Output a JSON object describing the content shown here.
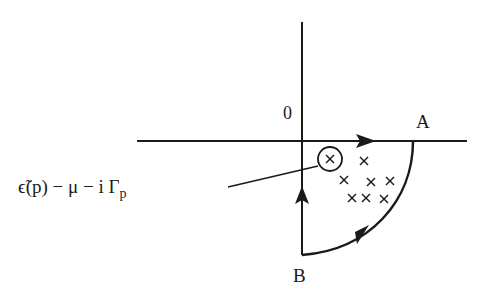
{
  "diagram": {
    "type": "complex-plane contour",
    "labels": {
      "origin": "0",
      "point_a": "A",
      "point_b": "B",
      "pole_expression": "ϵ̃(p) − μ − i Γ",
      "pole_expression_subscript": "p"
    },
    "elements": {
      "real_axis": "horizontal axis",
      "imaginary_axis": "vertical axis",
      "contour": "quarter-circle contour in lower-right quadrant: 0 → A along real axis, arc A → B, B → 0 along imaginary axis",
      "poles": "cluster of × marks inside contour, one circled and annotated",
      "pole_count": 9
    },
    "colors": {
      "ink": "#1a1a1a",
      "background": "#ffffff"
    }
  }
}
